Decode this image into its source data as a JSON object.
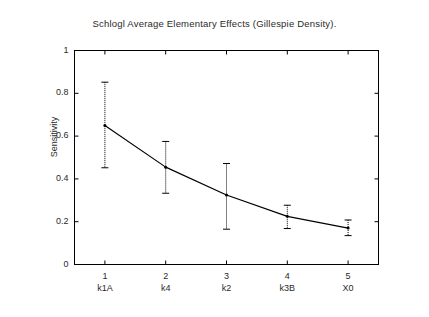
{
  "chart_data": {
    "type": "line",
    "title": "Schlogl Average Elementary Effects (Gillespie Density).",
    "xlabel": "",
    "ylabel": "Sensitivity",
    "ylim": [
      0,
      1
    ],
    "xlim": [
      0.5,
      5.5
    ],
    "grid": false,
    "legend": null,
    "y_ticks": [
      "0",
      "0.2",
      "0.4",
      "0.6",
      "0.8",
      "1"
    ],
    "y_tick_values": [
      0,
      0.2,
      0.4,
      0.6,
      0.8,
      1
    ],
    "x_ticks": [
      "1",
      "2",
      "3",
      "4",
      "5"
    ],
    "x_tick_values": [
      1,
      2,
      3,
      4,
      5
    ],
    "categories": [
      "k1A",
      "k4",
      "k2",
      "k3B",
      "X0"
    ],
    "series": [
      {
        "name": "Average Elementary Effect",
        "values": [
          0.65,
          0.455,
          0.325,
          0.225,
          0.17
        ],
        "err_low": [
          0.452,
          0.333,
          0.165,
          0.168,
          0.135
        ],
        "err_high": [
          0.852,
          0.575,
          0.472,
          0.277,
          0.208
        ]
      }
    ],
    "marker": "dot",
    "errorbar_style": "dotted",
    "line_color": "#000000",
    "axis_color": "#000000",
    "background": "#ffffff"
  }
}
